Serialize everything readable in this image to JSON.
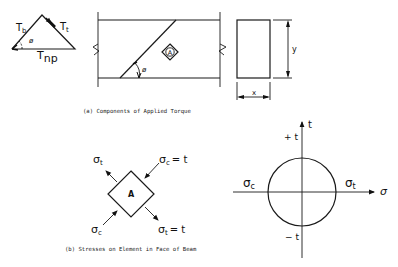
{
  "figure": {
    "part_a": {
      "caption": "(a)  Components of Applied Torque",
      "vector_triangle": {
        "labels": {
          "bending": "T",
          "bending_sub": "b",
          "torsion": "T",
          "torsion_sub": "t",
          "applied": "T",
          "applied_sub": "np",
          "angle": "ø"
        }
      },
      "beam_elevation": {
        "element_label": "A",
        "angle_label": "ø"
      },
      "cross_section": {
        "width_label": "x",
        "height_label": "y"
      }
    },
    "part_b": {
      "caption": "(b)  Stresses on Element in Face of Beam",
      "stress_element": {
        "element_label": "A",
        "labels": {
          "sigma_t_top": "σ",
          "sigma_t_top_sub": "t",
          "sigma_c_top": "σ",
          "sigma_c_top_sub": "c",
          "sigma_c_top_eq": "= t",
          "sigma_c_bottom": "σ",
          "sigma_c_bottom_sub": "c",
          "sigma_t_bottom": "σ",
          "sigma_t_bottom_sub": "t",
          "sigma_t_bottom_eq": "= t"
        }
      },
      "mohr_circle": {
        "vertical_axis_label": "t",
        "horizontal_axis_label": "σ",
        "top_label": "+ t",
        "bottom_label": "− t",
        "left_label": "σ",
        "left_label_sub": "c",
        "right_label": "σ",
        "right_label_sub": "t"
      }
    }
  }
}
